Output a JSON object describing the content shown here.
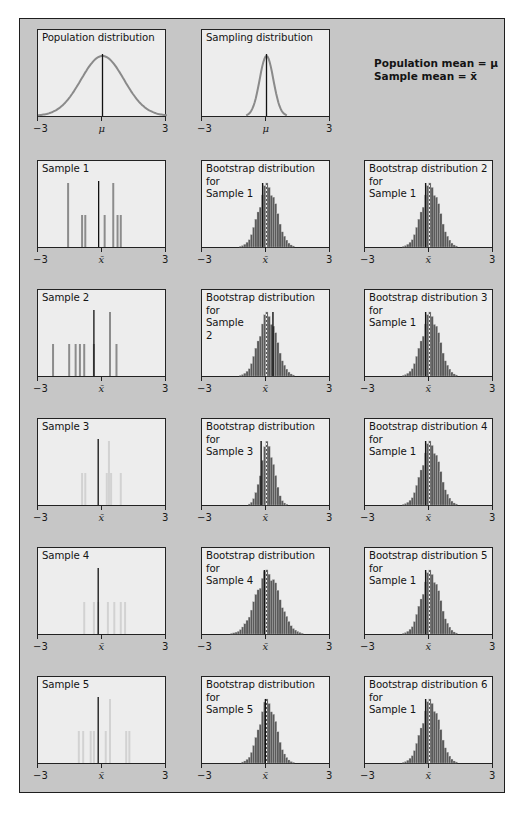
{
  "legend": {
    "line1": "Population mean = μ",
    "line2": "Sample mean = x̄"
  },
  "axis": {
    "min_label": "−3",
    "max_label": "3",
    "mu_label": "μ",
    "xbar_label": "x̄"
  },
  "colors": {
    "frame_bg": "#c6c6c6",
    "panel_bg": "#ededed",
    "curve": "#8a8a8a",
    "sample_bar_dark": "#8c8c8c",
    "sample_bar_light": "#d2d2d2",
    "mean_line": "#111111",
    "hist_fill": "#5a5a5a"
  },
  "panels": [
    {
      "id": "population",
      "title": "Population distribution",
      "row": 0,
      "col": 0,
      "center_label": "μ"
    },
    {
      "id": "sampling",
      "title": "Sampling distribution",
      "row": 0,
      "col": 1,
      "center_label": "μ"
    },
    {
      "id": "sample1",
      "title": "Sample 1",
      "row": 1,
      "col": 0,
      "center_label": "x̄"
    },
    {
      "id": "boot1",
      "title": "Bootstrap distribution\nfor\nSample 1",
      "row": 1,
      "col": 1,
      "center_label": "x̄"
    },
    {
      "id": "boot2s1",
      "title": "Bootstrap distribution 2\nfor\nSample 1",
      "row": 1,
      "col": 2,
      "center_label": "x̄"
    },
    {
      "id": "sample2",
      "title": "Sample 2",
      "row": 2,
      "col": 0,
      "center_label": "x̄"
    },
    {
      "id": "boot2",
      "title": "Bootstrap distribution\nfor\nSample\n2",
      "row": 2,
      "col": 1,
      "center_label": "x̄"
    },
    {
      "id": "boot3s1",
      "title": "Bootstrap distribution 3\nfor\nSample 1",
      "row": 2,
      "col": 2,
      "center_label": "x̄"
    },
    {
      "id": "sample3",
      "title": "Sample 3",
      "row": 3,
      "col": 0,
      "center_label": "x̄"
    },
    {
      "id": "boot3",
      "title": "Bootstrap distribution\nfor\nSample 3",
      "row": 3,
      "col": 1,
      "center_label": "x̄"
    },
    {
      "id": "boot4s1",
      "title": "Bootstrap distribution 4\nfor\nSample 1",
      "row": 3,
      "col": 2,
      "center_label": "x̄"
    },
    {
      "id": "sample4",
      "title": "Sample 4",
      "row": 4,
      "col": 0,
      "center_label": "x̄"
    },
    {
      "id": "boot4",
      "title": "Bootstrap distribution\nfor\nSample 4",
      "row": 4,
      "col": 1,
      "center_label": "x̄"
    },
    {
      "id": "boot5s1",
      "title": "Bootstrap distribution 5\nfor\nSample 1",
      "row": 4,
      "col": 2,
      "center_label": "x̄"
    },
    {
      "id": "sample5",
      "title": "Sample 5",
      "row": 5,
      "col": 0,
      "center_label": "x̄"
    },
    {
      "id": "boot5",
      "title": "Bootstrap distribution\nfor\nSample 5",
      "row": 5,
      "col": 1,
      "center_label": "x̄"
    },
    {
      "id": "boot6s1",
      "title": "Bootstrap distribution 6\nfor\nSample 1",
      "row": 5,
      "col": 2,
      "center_label": "x̄"
    }
  ],
  "chart_data": [
    {
      "type": "line",
      "title": "Population distribution",
      "x_range": [
        -3,
        3
      ],
      "series": [
        {
          "name": "normal density",
          "mean": 0,
          "sd": 1
        }
      ],
      "xtick_labels": [
        "−3",
        "μ",
        "3"
      ],
      "mean_line_x": 0
    },
    {
      "type": "line",
      "title": "Sampling distribution",
      "x_range": [
        -3,
        3
      ],
      "series": [
        {
          "name": "sampling density",
          "mean": 0,
          "sd": 0.32
        }
      ],
      "xtick_labels": [
        "−3",
        "μ",
        "3"
      ],
      "mean_line_x": 0
    },
    {
      "type": "bar",
      "title": "Sample 1",
      "x_range": [
        -3,
        3
      ],
      "x": [
        -1.6,
        -0.95,
        -0.8,
        -0.2,
        0.45,
        0.8,
        0.95,
        -0.3
      ],
      "heights": [
        2,
        1,
        1,
        1,
        2,
        1,
        1
      ],
      "points": [
        {
          "x": -1.6,
          "h": 2
        },
        {
          "x": -0.95,
          "h": 1
        },
        {
          "x": -0.8,
          "h": 1
        },
        {
          "x": 0.1,
          "h": 1
        },
        {
          "x": 0.5,
          "h": 2
        },
        {
          "x": 0.7,
          "h": 1
        },
        {
          "x": 0.85,
          "h": 1
        }
      ],
      "sample_mean": -0.18,
      "xtick_labels": [
        "−3",
        "x̄",
        "3"
      ],
      "bar_shade": "dark"
    },
    {
      "type": "bar",
      "title": "Bootstrap distribution for Sample 1",
      "x_range": [
        -3,
        3
      ],
      "center": 0,
      "sd": 0.42,
      "sample_mean": -0.18,
      "population_mean_marker": 0,
      "xtick_labels": [
        "−3",
        "x̄",
        "3"
      ]
    },
    {
      "type": "bar",
      "title": "Bootstrap distribution 2 for Sample 1",
      "x_range": [
        -3,
        3
      ],
      "center": 0,
      "sd": 0.42,
      "sample_mean": -0.18,
      "xtick_labels": [
        "−3",
        "x̄",
        "3"
      ]
    },
    {
      "type": "bar",
      "title": "Sample 2",
      "x_range": [
        -3,
        3
      ],
      "points": [
        {
          "x": -2.3,
          "h": 1
        },
        {
          "x": -1.55,
          "h": 1
        },
        {
          "x": -1.25,
          "h": 1
        },
        {
          "x": -1.05,
          "h": 1
        },
        {
          "x": -0.85,
          "h": 1
        },
        {
          "x": -0.4,
          "h": 1
        },
        {
          "x": 0.35,
          "h": 2
        },
        {
          "x": 0.65,
          "h": 1
        }
      ],
      "sample_mean": -0.4,
      "xtick_labels": [
        "−3",
        "x̄",
        "3"
      ],
      "bar_shade": "dark"
    },
    {
      "type": "bar",
      "title": "Bootstrap distribution for Sample 2",
      "x_range": [
        -3,
        3
      ],
      "center": 0,
      "sd": 0.42,
      "sample_mean": 0.3,
      "xtick_labels": [
        "−3",
        "x̄",
        "3"
      ]
    },
    {
      "type": "bar",
      "title": "Bootstrap distribution 3 for Sample 1",
      "x_range": [
        -3,
        3
      ],
      "center": 0,
      "sd": 0.42,
      "sample_mean": -0.18,
      "xtick_labels": [
        "−3",
        "x̄",
        "3"
      ]
    },
    {
      "type": "bar",
      "title": "Sample 3",
      "x_range": [
        -3,
        3
      ],
      "points": [
        {
          "x": -0.95,
          "h": 1
        },
        {
          "x": -0.8,
          "h": 1
        },
        {
          "x": 0.2,
          "h": 1
        },
        {
          "x": 0.3,
          "h": 2
        },
        {
          "x": 0.4,
          "h": 1
        },
        {
          "x": 0.85,
          "h": 1
        }
      ],
      "sample_mean": -0.2,
      "xtick_labels": [
        "−3",
        "x̄",
        "3"
      ],
      "bar_shade": "light"
    },
    {
      "type": "bar",
      "title": "Bootstrap distribution for Sample 3",
      "x_range": [
        -3,
        3
      ],
      "center": 0,
      "sd": 0.3,
      "sample_mean": -0.25,
      "xtick_labels": [
        "−3",
        "x̄",
        "3"
      ]
    },
    {
      "type": "bar",
      "title": "Bootstrap distribution 4 for Sample 1",
      "x_range": [
        -3,
        3
      ],
      "center": 0,
      "sd": 0.42,
      "sample_mean": -0.18,
      "xtick_labels": [
        "−3",
        "x̄",
        "3"
      ]
    },
    {
      "type": "bar",
      "title": "Sample 4",
      "x_range": [
        -3,
        3
      ],
      "points": [
        {
          "x": -0.85,
          "h": 1
        },
        {
          "x": -0.4,
          "h": 1
        },
        {
          "x": -0.2,
          "h": 1
        },
        {
          "x": 0.25,
          "h": 1
        },
        {
          "x": 0.55,
          "h": 1
        },
        {
          "x": 0.85,
          "h": 1
        },
        {
          "x": 1.05,
          "h": 1
        }
      ],
      "sample_mean": -0.2,
      "xtick_labels": [
        "−3",
        "x̄",
        "3"
      ],
      "bar_shade": "light"
    },
    {
      "type": "bar",
      "title": "Bootstrap distribution for Sample 4",
      "x_range": [
        -3,
        3
      ],
      "center": 0,
      "sd": 0.55,
      "sample_mean": -0.1,
      "xtick_labels": [
        "−3",
        "x̄",
        "3"
      ]
    },
    {
      "type": "bar",
      "title": "Bootstrap distribution 5 for Sample 1",
      "x_range": [
        -3,
        3
      ],
      "center": 0,
      "sd": 0.42,
      "sample_mean": -0.18,
      "xtick_labels": [
        "−3",
        "x̄",
        "3"
      ]
    },
    {
      "type": "bar",
      "title": "Sample 5",
      "x_range": [
        -3,
        3
      ],
      "points": [
        {
          "x": -1.1,
          "h": 1
        },
        {
          "x": -0.9,
          "h": 1
        },
        {
          "x": -0.55,
          "h": 1
        },
        {
          "x": -0.4,
          "h": 1
        },
        {
          "x": 0.15,
          "h": 1
        },
        {
          "x": 0.35,
          "h": 2
        },
        {
          "x": 1.1,
          "h": 1
        },
        {
          "x": 1.25,
          "h": 1
        }
      ],
      "sample_mean": -0.2,
      "xtick_labels": [
        "−3",
        "x̄",
        "3"
      ],
      "bar_shade": "light"
    },
    {
      "type": "bar",
      "title": "Bootstrap distribution for Sample 5",
      "x_range": [
        -3,
        3
      ],
      "center": 0,
      "sd": 0.4,
      "sample_mean": -0.05,
      "xtick_labels": [
        "−3",
        "x̄",
        "3"
      ]
    },
    {
      "type": "bar",
      "title": "Bootstrap distribution 6 for Sample 1",
      "x_range": [
        -3,
        3
      ],
      "center": 0,
      "sd": 0.42,
      "sample_mean": -0.18,
      "xtick_labels": [
        "−3",
        "x̄",
        "3"
      ]
    }
  ]
}
